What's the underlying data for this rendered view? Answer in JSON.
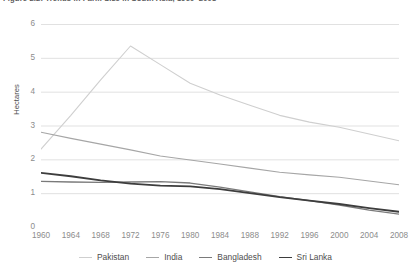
{
  "figure": {
    "title": "Figure 2.2: Trends in Farm Size in South Asia, 1960–2008"
  },
  "axes": {
    "y_title": "Hectares",
    "y_ticks": [
      "0",
      "1",
      "2",
      "3",
      "4",
      "5",
      "6"
    ],
    "x_ticks": [
      "1960",
      "1964",
      "1968",
      "1972",
      "1976",
      "1980",
      "1984",
      "1988",
      "1992",
      "1996",
      "2000",
      "2004",
      "2008"
    ]
  },
  "legend": {
    "position": "bottom-center",
    "entries": [
      {
        "label": "Pakistan",
        "color": "#cfcfcf",
        "width": 1.1
      },
      {
        "label": "India",
        "color": "#a6a6a6",
        "width": 1.1
      },
      {
        "label": "Bangladesh",
        "color": "#7a7a7a",
        "width": 1.3
      },
      {
        "label": "Sri Lanka",
        "color": "#3d3d3d",
        "width": 1.8
      }
    ]
  },
  "chart_data": {
    "type": "line",
    "title": "Figure 2.2: Trends in Farm Size in South Asia, 1960–2008",
    "xlabel": "",
    "ylabel": "Hectares",
    "xlim": [
      1960,
      2008
    ],
    "ylim": [
      0,
      6
    ],
    "grid": true,
    "legend_position": "bottom-center",
    "x": [
      1960,
      1964,
      1968,
      1972,
      1976,
      1980,
      1984,
      1988,
      1992,
      1996,
      2000,
      2004,
      2008
    ],
    "series": [
      {
        "name": "Pakistan",
        "color": "#cfcfcf",
        "values": [
          2.3,
          3.3,
          4.35,
          5.35,
          4.8,
          4.25,
          3.9,
          3.6,
          3.3,
          3.1,
          2.95,
          2.75,
          2.55
        ]
      },
      {
        "name": "India",
        "color": "#a6a6a6",
        "values": [
          2.8,
          2.62,
          2.45,
          2.28,
          2.1,
          1.98,
          1.86,
          1.74,
          1.62,
          1.54,
          1.47,
          1.36,
          1.25
        ]
      },
      {
        "name": "Bangladesh",
        "color": "#7a7a7a",
        "values": [
          1.35,
          1.33,
          1.32,
          1.33,
          1.34,
          1.3,
          1.18,
          1.04,
          0.9,
          0.78,
          0.65,
          0.5,
          0.38
        ]
      },
      {
        "name": "Sri Lanka",
        "color": "#3d3d3d",
        "values": [
          1.6,
          1.5,
          1.38,
          1.28,
          1.22,
          1.2,
          1.12,
          1.0,
          0.88,
          0.78,
          0.68,
          0.56,
          0.45
        ]
      }
    ]
  }
}
